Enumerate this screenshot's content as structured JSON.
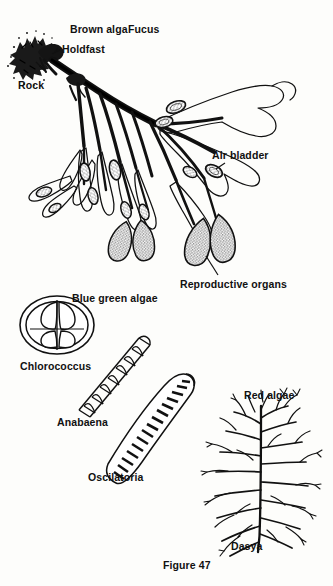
{
  "figure": {
    "caption": "Figure 47",
    "title_labels": {
      "brown_alga": "Brown alga",
      "fucus": "Fucus",
      "blue_green_algae": "Blue green algae",
      "red_algae": "Red algae"
    }
  },
  "brown_alga_diagram": {
    "name": "fucus-thallus",
    "labels": {
      "holdfast": "Holdfast",
      "rock": "Rock",
      "air_bladder": "Air bladder",
      "reproductive_organs": "Reproductive organs"
    }
  },
  "blue_green_algae_diagrams": [
    {
      "name": "chlorococcus",
      "label": "Chlorococcus"
    },
    {
      "name": "anabaena",
      "label": "Anabaena"
    },
    {
      "name": "oscilatoria",
      "label": "Oscilatoria"
    }
  ],
  "red_algae_diagram": {
    "name": "dasya",
    "label": "Dasya"
  },
  "colors": {
    "ink": "#111111",
    "page": "#fdfdfb",
    "stipple": "#3a3a3a"
  }
}
